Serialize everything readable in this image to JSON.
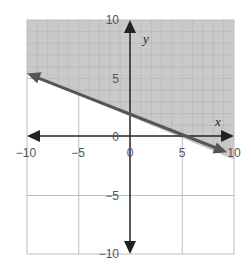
{
  "chart_data": {
    "type": "line",
    "title": "",
    "xlabel": "x",
    "ylabel": "y",
    "xlim": [
      -10,
      10
    ],
    "ylim": [
      -10,
      10
    ],
    "grid": true,
    "major_ticks": 5,
    "x_tick_labels": [
      "−10",
      "−5",
      "0",
      "5",
      "10"
    ],
    "y_tick_labels": [
      "10",
      "5",
      "0",
      "−5",
      "−10"
    ],
    "boundary_line": {
      "equation": "y = -1/3 x + 2",
      "slope": -0.3333,
      "intercept": 2,
      "style": "solid",
      "arrows": "both",
      "points": [
        [
          -10,
          5.33
        ],
        [
          9.5,
          -1.17
        ]
      ]
    },
    "shaded_region": "above the line (y > -1/3 x + 2)",
    "colors": {
      "shade": "#c9c9c9",
      "line": "#555555",
      "axis": "#222222",
      "major_grid": "#bdbdbd",
      "minor_grid": "#b4b4b4"
    }
  }
}
